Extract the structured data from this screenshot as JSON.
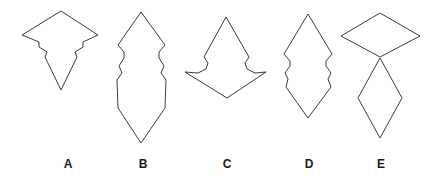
{
  "figure": {
    "background_color": "#ffffff",
    "stroke_color": "#3b3b3b",
    "label_color": "#1a1a1a",
    "width": 436,
    "height": 180
  },
  "shapes": [
    {
      "id": "shape-a",
      "label": "A",
      "label_x": 56,
      "label_y": 157,
      "description": "arrowhead-with-notched-shoulders pointing down",
      "closed": true,
      "points": "61,11 98,35 83,42 83,47 75,52 77,57 61,90 45,57 47,52 39,47 39,42 22,35",
      "parts": [
        "61,11 98,35 83,42 83,47 75,52 77,57 61,90 45,57 47,52 39,47 39,42 22,35"
      ]
    },
    {
      "id": "shape-b",
      "label": "B",
      "label_x": 131,
      "label_y": 157,
      "description": "two tall diamonds stacked sharing a pinched waist",
      "closed": true,
      "points": "141,12 165,45 159,52 159,58 164,66 161,73 166,80 165,108 141,143 118,108 117,80 122,73 119,66 124,58 124,52 118,45",
      "parts": [
        "141,12 165,45 159,52 159,58 164,66 161,73 166,80 165,108 141,143 118,108 117,80 122,73 119,66 124,58 124,52 118,45"
      ]
    },
    {
      "id": "shape-c",
      "label": "C",
      "label_x": 215,
      "label_y": 157,
      "description": "narrow peak above a wide notched diamond base",
      "closed": true,
      "points": "226,17 249,57 245,63 247,69 255,73 266,72 227,98 185,72 198,73 206,69 208,63 204,57",
      "parts": [
        "226,17 249,57 245,63 247,69 255,73 266,72 227,98 185,72 198,73 206,69 208,63 204,57"
      ]
    },
    {
      "id": "shape-d",
      "label": "D",
      "label_x": 297,
      "label_y": 157,
      "description": "tall diamond with symmetric notched waist",
      "closed": true,
      "points": "308,14 332,54 326,61 326,66 331,73 328,79 331,87 308,118 286,87 288,79 285,73 290,66 290,61 284,54",
      "parts": [
        "308,14 332,54 326,61 326,66 331,73 328,79 331,87 308,118 286,87 288,79 285,73 290,66 290,61 284,54"
      ]
    },
    {
      "id": "shape-e",
      "label": "E",
      "label_x": 369,
      "label_y": 157,
      "description": "wide flat diamond on top of a tall narrow diamond, touching at a point",
      "closed": true,
      "points": "",
      "parts": [
        "380,13 420,36 380,57 341,36",
        "380,58 402,98 380,138 358,98"
      ]
    }
  ]
}
